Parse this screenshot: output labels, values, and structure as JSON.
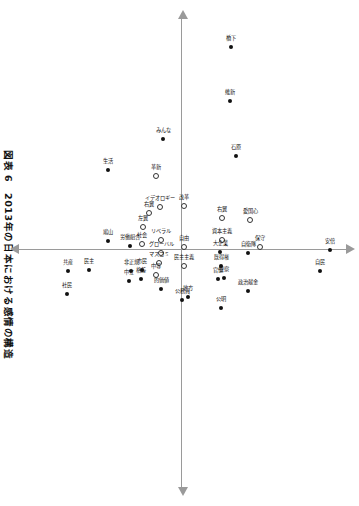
{
  "figure": {
    "title": "図表 6　2013年の日本における感情の構造",
    "axes": {
      "horizontal_name": "horizontal-axis",
      "vertical_name": "vertical-axis",
      "arrow_left": "arrow-left",
      "arrow_right": "arrow-right",
      "arrow_up": "arrow-up",
      "arrow_down": "arrow-down"
    }
  },
  "chart_data": {
    "type": "scatter",
    "title": "図表 6　2013年の日本における感情の構造",
    "xlabel": "",
    "ylabel": "",
    "xlim": [
      -1.0,
      1.0
    ],
    "ylim": [
      -1.0,
      1.0
    ],
    "grid": false,
    "legend": "none",
    "rotation_deg": 90,
    "marker_styles": [
      "filled",
      "open"
    ],
    "points": [
      {
        "label": "安倍",
        "x": 0.005,
        "y": 0.905,
        "marker": "filled"
      },
      {
        "label": "自民",
        "x": 0.095,
        "y": 0.845,
        "marker": "filled"
      },
      {
        "label": "橋下",
        "x": -0.845,
        "y": 0.295,
        "marker": "filled"
      },
      {
        "label": "維新",
        "x": -0.62,
        "y": 0.29,
        "marker": "filled"
      },
      {
        "label": "石原",
        "x": -0.39,
        "y": 0.33,
        "marker": "filled"
      },
      {
        "label": "愛国心",
        "x": -0.12,
        "y": 0.415,
        "marker": "open"
      },
      {
        "label": "自衛隊",
        "x": 0.02,
        "y": 0.4,
        "marker": "filled"
      },
      {
        "label": "保守",
        "x": -0.005,
        "y": 0.475,
        "marker": "open"
      },
      {
        "label": "政治献金",
        "x": 0.18,
        "y": 0.4,
        "marker": "filled"
      },
      {
        "label": "右翼",
        "x": -0.13,
        "y": 0.245,
        "marker": "open"
      },
      {
        "label": "資本主義",
        "x": -0.035,
        "y": 0.245,
        "marker": "open"
      },
      {
        "label": "大企業",
        "x": 0.015,
        "y": 0.23,
        "marker": "filled"
      },
      {
        "label": "既得権",
        "x": 0.075,
        "y": 0.235,
        "marker": "filled"
      },
      {
        "label": "警察",
        "x": 0.125,
        "y": 0.255,
        "marker": "filled"
      },
      {
        "label": "官僚",
        "x": 0.13,
        "y": 0.215,
        "marker": "filled"
      },
      {
        "label": "公明",
        "x": 0.25,
        "y": 0.235,
        "marker": "filled"
      },
      {
        "label": "改革",
        "x": -0.18,
        "y": 0.01,
        "marker": "open"
      },
      {
        "label": "自由",
        "x": -0.005,
        "y": 0.01,
        "marker": "open"
      },
      {
        "label": "民主主義",
        "x": 0.075,
        "y": 0.01,
        "marker": "open"
      },
      {
        "label": "地方",
        "x": 0.205,
        "y": 0.035,
        "marker": "filled"
      },
      {
        "label": "公務員",
        "x": 0.215,
        "y": -0.005,
        "marker": "filled"
      },
      {
        "label": "みんな",
        "x": -0.46,
        "y": -0.12,
        "marker": "filled"
      },
      {
        "label": "革新",
        "x": -0.305,
        "y": -0.165,
        "marker": "open"
      },
      {
        "label": "イデオロギー",
        "x": -0.175,
        "y": -0.135,
        "marker": "open"
      },
      {
        "label": "右翼2",
        "x": -0.15,
        "y": -0.205,
        "marker": "open"
      },
      {
        "label": "リベラル",
        "x": -0.035,
        "y": -0.13,
        "marker": "open"
      },
      {
        "label": "グローバル",
        "x": 0.02,
        "y": -0.13,
        "marker": "open"
      },
      {
        "label": "マスコミ",
        "x": 0.06,
        "y": -0.145,
        "marker": "open"
      },
      {
        "label": "中等",
        "x": 0.11,
        "y": -0.165,
        "marker": "open"
      },
      {
        "label": "的価値",
        "x": 0.17,
        "y": -0.13,
        "marker": "filled"
      },
      {
        "label": "社会",
        "x": -0.02,
        "y": -0.25,
        "marker": "open"
      },
      {
        "label": "左翼",
        "x": -0.09,
        "y": -0.245,
        "marker": "open"
      },
      {
        "label": "市民",
        "x": 0.09,
        "y": -0.25,
        "marker": "filled"
      },
      {
        "label": "格差",
        "x": 0.13,
        "y": -0.255,
        "marker": "filled"
      },
      {
        "label": "労働組合",
        "x": -0.01,
        "y": -0.325,
        "marker": "filled"
      },
      {
        "label": "非正規",
        "x": 0.095,
        "y": -0.315,
        "marker": "filled"
      },
      {
        "label": "中立",
        "x": 0.135,
        "y": -0.33,
        "marker": "filled"
      },
      {
        "label": "生活",
        "x": -0.33,
        "y": -0.455,
        "marker": "filled"
      },
      {
        "label": "鳩山",
        "x": -0.03,
        "y": -0.46,
        "marker": "filled"
      },
      {
        "label": "民主",
        "x": 0.09,
        "y": -0.575,
        "marker": "filled"
      },
      {
        "label": "共産",
        "x": 0.095,
        "y": -0.7,
        "marker": "filled"
      },
      {
        "label": "社民",
        "x": 0.19,
        "y": -0.71,
        "marker": "filled"
      }
    ]
  },
  "labels": {
    "p0": "安倍",
    "p1": "自民",
    "p2": "橋下",
    "p3": "維新",
    "p4": "石原",
    "p5": "愛国心",
    "p6": "自衛隊",
    "p7": "保守",
    "p8": "政治献金",
    "p9": "右翼",
    "p10": "資本主義",
    "p11": "大企業",
    "p12": "既得権",
    "p13": "警察",
    "p14": "官僚",
    "p15": "公明",
    "p16": "改革",
    "p17": "自由",
    "p18": "民主主義",
    "p19": "地方",
    "p20": "公務員",
    "p21": "みんな",
    "p22": "革新",
    "p23": "イデオロギー",
    "p24": "右翼",
    "p25": "リベラル",
    "p26": "グローバル",
    "p27": "マスコミ",
    "p28": "中等",
    "p29": "的価値",
    "p30": "社会",
    "p31": "左翼",
    "p32": "市民",
    "p33": "格差",
    "p34": "労働組合",
    "p35": "非正規",
    "p36": "中立",
    "p37": "生活",
    "p38": "鳩山",
    "p39": "民主",
    "p40": "共産",
    "p41": "社民"
  }
}
